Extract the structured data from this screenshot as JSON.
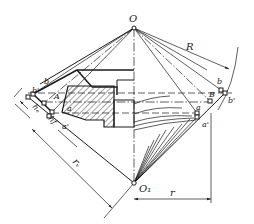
{
  "figure": {
    "type": "bevel-gear back-cone construction diagram",
    "background": "#ffffff",
    "line_color": "#1a1a1a"
  },
  "labels": {
    "apex": "O",
    "back_cone_center": "O₁",
    "cone_distance": "R",
    "back_cone_radius": "r",
    "virtual_radius": "rᵥ",
    "addendum": "hₐ",
    "dedendum": "hf",
    "left_b": "b",
    "left_b_prime": "b'",
    "left_A": "A",
    "left_a": "a",
    "left_a_prime": "a'",
    "right_b": "b",
    "right_b_prime": "b'",
    "right_B": "B",
    "right_a": "a",
    "right_a_prime": "a'"
  },
  "points": {
    "O": [
      134,
      28
    ],
    "O1": [
      134,
      183
    ],
    "left_b_prime": [
      28,
      97
    ],
    "left_b": [
      33,
      94
    ],
    "left_A": [
      44,
      103
    ],
    "left_a": [
      52,
      112
    ],
    "left_a_prime": [
      49,
      116
    ],
    "right_b": [
      221,
      90
    ],
    "right_b_prime": [
      225,
      93
    ],
    "right_B": [
      210,
      101
    ],
    "right_a": [
      197,
      113
    ],
    "right_a_prime": [
      197,
      117
    ]
  }
}
